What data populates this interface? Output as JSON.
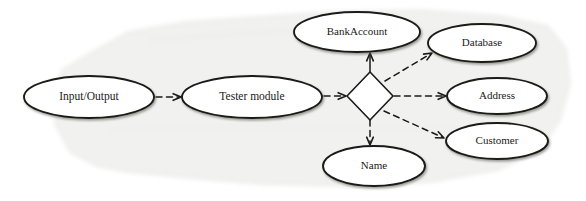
{
  "diagram": {
    "background_color": "#ffffff",
    "paper_tint": "#f3f3f1",
    "stroke_color": "#1a1a18",
    "text_color": "#1a1a18",
    "node_fill": "#ffffff",
    "nodes": [
      {
        "id": "input-output",
        "label": "Input/Output",
        "shape": "ellipse",
        "cx": 89,
        "cy": 97,
        "rx": 65,
        "ry": 21,
        "font_size": 11.5
      },
      {
        "id": "tester-module",
        "label": "Tester module",
        "shape": "ellipse",
        "cx": 252,
        "cy": 97,
        "rx": 70,
        "ry": 21,
        "font_size": 11.5
      },
      {
        "id": "bankaccount",
        "label": "BankAccount",
        "shape": "ellipse",
        "cx": 357,
        "cy": 32,
        "rx": 63,
        "ry": 20,
        "font_size": 11
      },
      {
        "id": "database",
        "label": "Database",
        "shape": "ellipse",
        "cx": 482,
        "cy": 43,
        "rx": 54,
        "ry": 19,
        "font_size": 11
      },
      {
        "id": "address",
        "label": "Address",
        "shape": "ellipse",
        "cx": 497,
        "cy": 96,
        "rx": 50,
        "ry": 18,
        "font_size": 11
      },
      {
        "id": "customer",
        "label": "Customer",
        "shape": "ellipse",
        "cx": 497,
        "cy": 141,
        "rx": 51,
        "ry": 18,
        "font_size": 11
      },
      {
        "id": "name",
        "label": "Name",
        "shape": "ellipse",
        "cx": 374,
        "cy": 166,
        "rx": 51,
        "ry": 20,
        "font_size": 11
      },
      {
        "id": "fork",
        "label": "",
        "shape": "diamond",
        "cx": 370,
        "cy": 96,
        "rx": 23,
        "ry": 24,
        "font_size": 0
      }
    ],
    "edges": [
      {
        "id": "io-to-tester",
        "from": "input-output",
        "to": "tester-module",
        "style": "dashed",
        "arrowhead": "open-v",
        "x1": 156,
        "y1": 97,
        "x2": 181,
        "y2": 97
      },
      {
        "id": "tester-to-fork",
        "from": "tester-module",
        "to": "fork",
        "style": "dashed",
        "arrowhead": "open-v",
        "x1": 324,
        "y1": 96,
        "x2": 346,
        "y2": 96
      },
      {
        "id": "fork-to-bankaccount",
        "from": "fork",
        "to": "bankaccount",
        "style": "solid",
        "arrowhead": "open-v",
        "x1": 370,
        "y1": 72,
        "x2": 370,
        "y2": 53
      },
      {
        "id": "fork-to-database",
        "from": "fork",
        "to": "database",
        "style": "dashed",
        "arrowhead": "open-v",
        "x1": 385,
        "y1": 81,
        "x2": 432,
        "y2": 53
      },
      {
        "id": "fork-to-address",
        "from": "fork",
        "to": "address",
        "style": "dashed",
        "arrowhead": "open-v",
        "x1": 394,
        "y1": 96,
        "x2": 446,
        "y2": 96
      },
      {
        "id": "fork-to-customer",
        "from": "fork",
        "to": "customer",
        "style": "dashed",
        "arrowhead": "open-v",
        "x1": 384,
        "y1": 111,
        "x2": 444,
        "y2": 138
      },
      {
        "id": "fork-to-name",
        "from": "fork",
        "to": "name",
        "style": "dashed",
        "arrowhead": "open-v",
        "x1": 370,
        "y1": 120,
        "x2": 370,
        "y2": 145
      }
    ]
  }
}
